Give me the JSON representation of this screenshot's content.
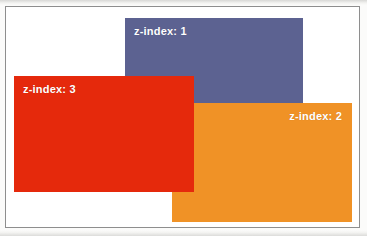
{
  "figure": {
    "frame_border_color": "#8e8e8e",
    "frame_background": "#ffffff",
    "page_background": "#fbfbfa",
    "boxes": [
      {
        "id": "box-blue",
        "label": "z-index: 1",
        "z_index": 1,
        "color": "#5c6291",
        "text_color": "#ffffff",
        "label_align": "left"
      },
      {
        "id": "box-orange",
        "label": "z-index: 2",
        "z_index": 2,
        "color": "#f09226",
        "text_color": "#ffffff",
        "label_align": "right"
      },
      {
        "id": "box-red",
        "label": "z-index: 3",
        "z_index": 3,
        "color": "#e5290c",
        "text_color": "#ffffff",
        "label_align": "left"
      }
    ]
  }
}
